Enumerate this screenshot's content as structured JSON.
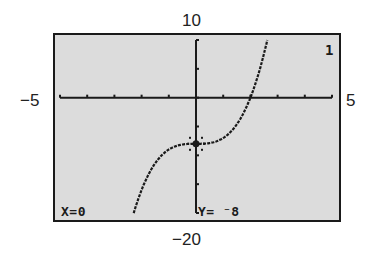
{
  "window": {
    "xmin": "−5",
    "xmax": "5",
    "ymin": "−20",
    "ymax": "10"
  },
  "screen": {
    "function_index": "1",
    "trace": {
      "x_readout": "X=0",
      "y_readout": "Y= ⁻8"
    }
  },
  "colors": {
    "screen_bg": "#dcdcdc",
    "ink": "#1a1a1a"
  },
  "chart_data": {
    "type": "line",
    "title": "",
    "function": "y = x^3 - 8",
    "xlabel": "",
    "ylabel": "",
    "xlim": [
      -5,
      5
    ],
    "ylim": [
      -20,
      10
    ],
    "xscale": 1,
    "yscale": 5,
    "grid": false,
    "series": [
      {
        "name": "Y1",
        "x": [
          -2.29,
          -2.0,
          -1.5,
          -1.0,
          -0.5,
          0,
          0.5,
          1.0,
          1.5,
          2.0,
          2.5,
          2.62
        ],
        "values": [
          -20,
          -16,
          -11.375,
          -9,
          -8.125,
          -8,
          -7.875,
          -7,
          -4.625,
          0,
          7.625,
          10
        ]
      }
    ],
    "trace_point": {
      "x": 0,
      "y": -8
    },
    "annotations": [
      "X=0",
      "Y= ⁻8",
      "1"
    ]
  }
}
